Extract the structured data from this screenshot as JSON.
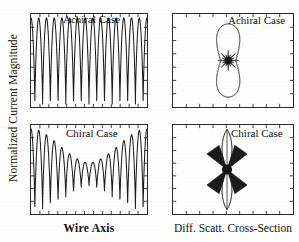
{
  "figure": {
    "ylabel": "Normalized Current Magnitude",
    "xlabel_left": "Wire Axis",
    "xlabel_right": "Diff. Scatt. Cross-Section"
  },
  "panels": {
    "top_left": {
      "title": "Achiral Case"
    },
    "bottom_left": {
      "title": "Chiral Case"
    },
    "top_right": {
      "title": "Achiral Case"
    },
    "bottom_right": {
      "title": "Chiral Case"
    }
  },
  "chart_data": [
    {
      "id": "top-left",
      "type": "line",
      "title": "Achiral Case",
      "xlabel": "Wire Axis",
      "ylabel": "Normalized Current Magnitude",
      "xlim": [
        0,
        1
      ],
      "ylim": [
        0,
        1
      ],
      "grid": false,
      "legend": "none",
      "axis_ticks": {
        "x_count": 13,
        "y_count": 7,
        "labels": "none"
      },
      "description": "Standing-wave current distribution of uniform amplitude along the wire; about 15 full oscillations with flat envelope.",
      "oscillation_cycles": 15,
      "envelope": "uniform",
      "x": [
        0.0,
        0.017,
        0.033,
        0.05,
        0.067,
        0.083,
        0.1,
        0.117,
        0.133,
        0.15,
        0.167,
        0.183,
        0.2,
        0.217,
        0.233,
        0.25,
        0.267,
        0.283,
        0.3,
        0.317,
        0.333,
        0.35,
        0.367,
        0.383,
        0.4,
        0.417,
        0.433,
        0.45,
        0.467,
        0.483,
        0.5,
        0.517,
        0.533,
        0.55,
        0.567,
        0.583,
        0.6,
        0.617,
        0.633,
        0.65,
        0.667,
        0.683,
        0.7,
        0.717,
        0.733,
        0.75,
        0.767,
        0.783,
        0.8,
        0.817,
        0.833,
        0.85,
        0.867,
        0.883,
        0.9,
        0.917,
        0.933,
        0.95,
        0.967,
        0.983,
        1.0
      ],
      "values": [
        0.95,
        0.52,
        0.06,
        0.5,
        0.95,
        0.52,
        0.06,
        0.5,
        0.95,
        0.52,
        0.06,
        0.5,
        0.95,
        0.52,
        0.06,
        0.5,
        0.95,
        0.52,
        0.06,
        0.5,
        0.95,
        0.52,
        0.06,
        0.5,
        0.95,
        0.52,
        0.06,
        0.5,
        0.95,
        0.52,
        0.06,
        0.5,
        0.95,
        0.52,
        0.06,
        0.5,
        0.95,
        0.52,
        0.06,
        0.5,
        0.95,
        0.52,
        0.06,
        0.5,
        0.95,
        0.52,
        0.06,
        0.5,
        0.95,
        0.52,
        0.06,
        0.5,
        0.95,
        0.52,
        0.06,
        0.5,
        0.95,
        0.52,
        0.06,
        0.5,
        0.95
      ]
    },
    {
      "id": "bottom-left",
      "type": "line",
      "title": "Chiral Case",
      "xlabel": "Wire Axis",
      "ylabel": "Normalized Current Magnitude",
      "xlim": [
        0,
        1
      ],
      "ylim": [
        0,
        1
      ],
      "grid": false,
      "legend": "none",
      "axis_ticks": {
        "x_count": 13,
        "y_count": 7,
        "labels": "none"
      },
      "description": "Standing-wave current distribution with amplitude modulated by a beat envelope; large amplitude near both wire ends, compressed amplitude at the center. About 15 oscillations.",
      "oscillation_cycles": 15,
      "envelope": "beat-modulated, minimum at center",
      "envelope_values": [
        1.0,
        0.93,
        0.82,
        0.68,
        0.55,
        0.45,
        0.39,
        0.37,
        0.39,
        0.45,
        0.55,
        0.68,
        0.82,
        0.93,
        1.0
      ]
    },
    {
      "id": "top-right",
      "type": "line",
      "title": "Achiral Case",
      "xlabel": "Diff. Scatt. Cross-Section",
      "xlim": [
        -1,
        1
      ],
      "ylim": [
        -1,
        1
      ],
      "grid": false,
      "legend": "none",
      "axis_ticks": {
        "x_count": 9,
        "y_count": 7,
        "labels": "none"
      },
      "description": "Polar differential scattering cross-section: a single large vertically elongated dipole lobe (figure-of-eight closed in on itself) with a dense multi-lobed starburst of small side lobes at the origin.",
      "pattern": "vertical elongated lobe with central starburst",
      "main_lobe_axis": "vertical",
      "main_lobe_half_height": 0.82,
      "main_lobe_half_width": 0.12,
      "side_lobe_count": 16,
      "side_lobe_radius": 0.13
    },
    {
      "id": "bottom-right",
      "type": "line",
      "title": "Chiral Case",
      "xlabel": "Diff. Scatt. Cross-Section",
      "xlim": [
        -1,
        1
      ],
      "ylim": [
        -1,
        1
      ],
      "grid": false,
      "legend": "none",
      "axis_ticks": {
        "x_count": 9,
        "y_count": 7,
        "labels": "none"
      },
      "description": "Polar differential scattering cross-section: two very narrow vertical spikes extending up and down, joined at the origin by an X-shaped (bowtie) set of four broad diagonal lobes.",
      "pattern": "narrow vertical spikes with central bowtie / X crossing",
      "spike_axis": "vertical",
      "spike_half_height": 0.92,
      "spike_half_width": 0.035,
      "bowtie_lobe_count": 4,
      "bowtie_radius": 0.3,
      "bowtie_angles_deg": [
        55,
        125,
        235,
        305
      ]
    }
  ]
}
